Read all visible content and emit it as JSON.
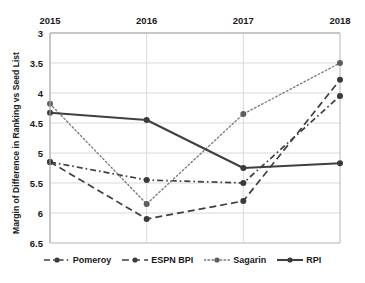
{
  "chart_data": {
    "type": "line",
    "title": "",
    "xlabel": "",
    "ylabel": "Margin of Difference in Ranking vs Seed List",
    "categories": [
      "2015",
      "2016",
      "2017",
      "2018"
    ],
    "ylim": [
      3,
      6.5
    ],
    "y_inverted": true,
    "y_ticks": [
      "3",
      "3.5",
      "4",
      "4.5",
      "5",
      "5.5",
      "6",
      "6.5"
    ],
    "y_tick_values": [
      3,
      3.5,
      4,
      4.5,
      5,
      5.5,
      6,
      6.5
    ],
    "grid": true,
    "x_axis_position": "top",
    "legend_position": "bottom",
    "series": [
      {
        "name": "Pomeroy",
        "values": [
          5.15,
          5.45,
          5.5,
          4.05
        ],
        "style": "dash-dot",
        "color": "#3f3f3f"
      },
      {
        "name": "ESPN BPI",
        "values": [
          5.15,
          6.1,
          5.8,
          3.78
        ],
        "style": "dashed",
        "color": "#3f3f3f"
      },
      {
        "name": "Sagarin",
        "values": [
          4.18,
          5.85,
          4.35,
          3.5
        ],
        "style": "dotted",
        "color": "#7a7a7a"
      },
      {
        "name": "RPI",
        "values": [
          4.33,
          4.45,
          5.25,
          5.17
        ],
        "style": "solid",
        "color": "#404040"
      }
    ]
  },
  "axis": {
    "y_title": "Margin of Difference in Ranking vs Seed List"
  },
  "legend": {
    "items": [
      {
        "label": "Pomeroy",
        "glyph": "dash-dot-marker-icon"
      },
      {
        "label": "ESPN BPI",
        "glyph": "dashed-marker-icon"
      },
      {
        "label": "Sagarin",
        "glyph": "dotted-marker-icon"
      },
      {
        "label": "RPI",
        "glyph": "solid-marker-icon"
      }
    ]
  },
  "colors": {
    "grid": "#d9d9d9",
    "axis": "#b5b5b5",
    "text": "#1a1a1a",
    "series_dark": "#3f3f3f",
    "series_light": "#7a7a7a"
  }
}
